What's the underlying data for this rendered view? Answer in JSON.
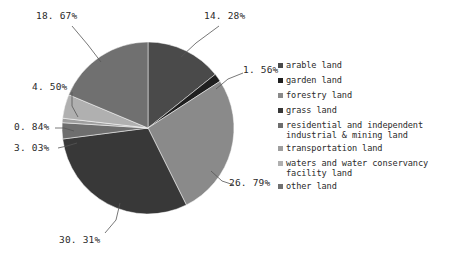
{
  "chart_data": {
    "type": "pie",
    "title": "",
    "categories": [
      "arable land",
      "garden land",
      "forestry land",
      "grass land",
      "residential and independent\nindustrial & mining land",
      "transportation land",
      "waters and water conservancy\nfacility land",
      "other land"
    ],
    "values": [
      14.28,
      1.56,
      26.79,
      30.31,
      3.03,
      0.84,
      4.5,
      18.67
    ],
    "value_labels": [
      "14.28%",
      "1.56%",
      "26.79%",
      "30.31%",
      "3.03%",
      "0.84%",
      "4.50%",
      "18.67%"
    ],
    "colors": [
      "#4a4a4a",
      "#1f1f1f",
      "#8a8a8a",
      "#383838",
      "#6e6e6e",
      "#9e9e9e",
      "#b0b0b0",
      "#707070"
    ],
    "unit": "%",
    "legend_position": "right",
    "start_angle_deg": 0,
    "direction": "clockwise",
    "grid": false,
    "xlabel": "",
    "ylabel": ""
  },
  "labels": {
    "arable": "14. 28%",
    "garden": "1. 56%",
    "forestry": "26. 79%",
    "grass": "30. 31%",
    "residential": "3. 03%",
    "transportation": "0. 84%",
    "waters": "4. 50%",
    "other": "18. 67%"
  },
  "legend": {
    "items": [
      {
        "label": "arable land",
        "color": "#4a4a4a"
      },
      {
        "label": "garden land",
        "color": "#1f1f1f"
      },
      {
        "label": "forestry land",
        "color": "#8a8a8a"
      },
      {
        "label": "grass land",
        "color": "#383838"
      },
      {
        "label": "residential and independent\nindustrial & mining land",
        "color": "#6e6e6e"
      },
      {
        "label": "transportation land",
        "color": "#9e9e9e"
      },
      {
        "label": "waters and water conservancy\nfacility land",
        "color": "#b0b0b0"
      },
      {
        "label": "other land",
        "color": "#707070"
      }
    ]
  }
}
